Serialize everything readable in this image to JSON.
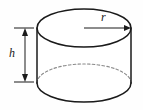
{
  "figure": {
    "name": "cylinder-diagram",
    "type": "geometric-solid",
    "solid": "cylinder",
    "background_color": "#fefefe",
    "stroke_color": "#1a1a1a",
    "dashed_stroke_color": "#8a8a8a",
    "labels": {
      "height": "h",
      "radius": "r"
    },
    "annotations": {
      "height_dimension_name": "height-dimension",
      "radius_dimension_name": "radius-dimension"
    }
  },
  "geometry": {
    "top_ellipse": {
      "cx": 84,
      "cy": 28,
      "rx": 47,
      "ry": 19
    },
    "bottom_ellipse": {
      "cx": 84,
      "cy": 83,
      "rx": 47,
      "ry": 19
    },
    "left_wall_x": 37,
    "right_wall_x": 131,
    "radius_arrow": {
      "x1": 84,
      "y1": 28,
      "x2": 129,
      "y2": 28
    },
    "height_dimension": {
      "x": 25,
      "y_top": 28,
      "y_bottom": 82
    },
    "extension_lines": {
      "x1": 14,
      "x2": 34
    }
  }
}
